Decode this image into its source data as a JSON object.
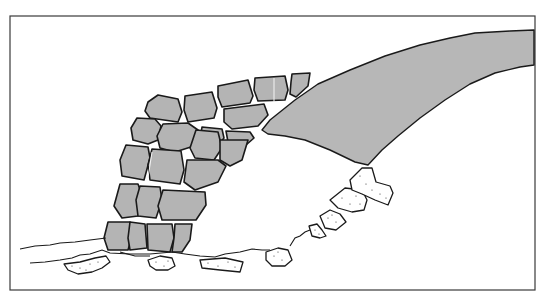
{
  "figure": {
    "colors": {
      "background": "#ffffff",
      "stone_fill": "#b4b4b4",
      "outline": "#1a1a1a",
      "frame": "#3a3a3a",
      "rubble_fill": "#ffffff"
    },
    "frame": {
      "x": 10,
      "y": 16,
      "width": 525,
      "height": 274
    }
  }
}
